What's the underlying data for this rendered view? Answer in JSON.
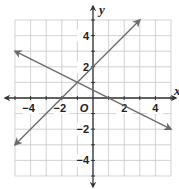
{
  "chart_data": {
    "type": "line",
    "title": "",
    "xlabel": "x",
    "ylabel": "y",
    "xlim": [
      -5,
      5
    ],
    "ylim": [
      -5,
      5
    ],
    "grid": true,
    "origin_label": "O",
    "x_tick_labels": [
      {
        "value": -4,
        "label": "−4"
      },
      {
        "value": -2,
        "label": "−2"
      },
      {
        "value": 2,
        "label": "2"
      },
      {
        "value": 4,
        "label": "4"
      }
    ],
    "y_tick_labels": [
      {
        "value": 4,
        "label": "4"
      },
      {
        "value": 2,
        "label": "2"
      },
      {
        "value": -2,
        "label": "−2"
      },
      {
        "value": -4,
        "label": "−4"
      }
    ],
    "series": [
      {
        "name": "line-1",
        "equation": "y = x + 2",
        "x": [
          -5,
          3
        ],
        "y": [
          -3,
          5
        ],
        "arrows": "both"
      },
      {
        "name": "line-2",
        "equation": "y = -0.5x + 0.5",
        "x": [
          -5,
          5
        ],
        "y": [
          3,
          -2
        ],
        "arrows": "both"
      }
    ],
    "intersection": {
      "x": -1,
      "y": 1
    }
  },
  "colors": {
    "grid": "#c8c8c8",
    "axis": "#333333",
    "line": "#6b6b6b",
    "text": "#222222"
  }
}
